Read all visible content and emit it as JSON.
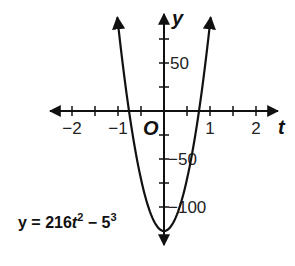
{
  "chart_data": {
    "type": "line",
    "title": "",
    "equation": "y = 216t^2 - 5^3",
    "equation_parts": {
      "lhs": "y = 216",
      "var": "t",
      "exp1": "2",
      "mid": " − 5",
      "exp2": "3"
    },
    "xlabel": "t",
    "ylabel": "y",
    "origin_label": "O",
    "xlim": [
      -2.5,
      2.4
    ],
    "ylim": [
      -135,
      100
    ],
    "x_ticks": [
      -2,
      -1.5,
      -1,
      -0.5,
      0.5,
      1,
      1.5,
      2
    ],
    "x_tick_labels": [
      {
        "value": -2,
        "label": "−2"
      },
      {
        "value": -1,
        "label": "−1"
      },
      {
        "value": 1,
        "label": "1"
      },
      {
        "value": 2,
        "label": "2"
      }
    ],
    "y_ticks": [
      -100,
      -75,
      -50,
      -25,
      25,
      50,
      75
    ],
    "y_tick_labels": [
      {
        "value": 50,
        "label": "50"
      },
      {
        "value": -50,
        "label": "−50"
      },
      {
        "value": -100,
        "label": "−100"
      }
    ],
    "grid": false,
    "series": [
      {
        "name": "y = 216t^2 - 125",
        "function": {
          "a": 216,
          "b": 0,
          "c": -125
        },
        "vertex": [
          0,
          -125
        ],
        "roots": [
          -0.761,
          0.761
        ]
      }
    ]
  },
  "layout": {
    "origin_px": [
      164,
      111
    ],
    "px_per_x_unit": 46,
    "px_per_y_unit": 0.96
  }
}
